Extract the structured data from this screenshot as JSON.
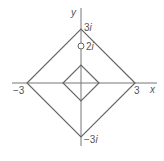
{
  "diagram": {
    "type": "complex-plane",
    "axes": {
      "x_label": "x",
      "y_label": "y",
      "x_range": [
        -3.8,
        4.2
      ],
      "y_range": [
        -3.4,
        4.2
      ]
    },
    "tick_labels": {
      "x_neg": "−3",
      "x_pos": "3",
      "y_pos": "3",
      "y_pos_suffix": "i",
      "y_pos_point": "2",
      "y_pos_point_suffix": "i",
      "y_neg": "−3",
      "y_neg_suffix": "i"
    },
    "shapes": [
      {
        "name": "outer-diamond",
        "vertices": [
          [
            3,
            0
          ],
          [
            0,
            3
          ],
          [
            -3,
            0
          ],
          [
            0,
            -3
          ]
        ]
      },
      {
        "name": "inner-diamond",
        "vertices": [
          [
            1,
            0
          ],
          [
            0,
            1
          ],
          [
            -1,
            0
          ],
          [
            0,
            -1
          ]
        ]
      }
    ],
    "points": [
      {
        "name": "open-point-2i",
        "x": 0,
        "y": 2,
        "style": "open-circle"
      }
    ],
    "colors": {
      "line": "#666666",
      "text": "#555555",
      "background": "#ffffff"
    }
  }
}
